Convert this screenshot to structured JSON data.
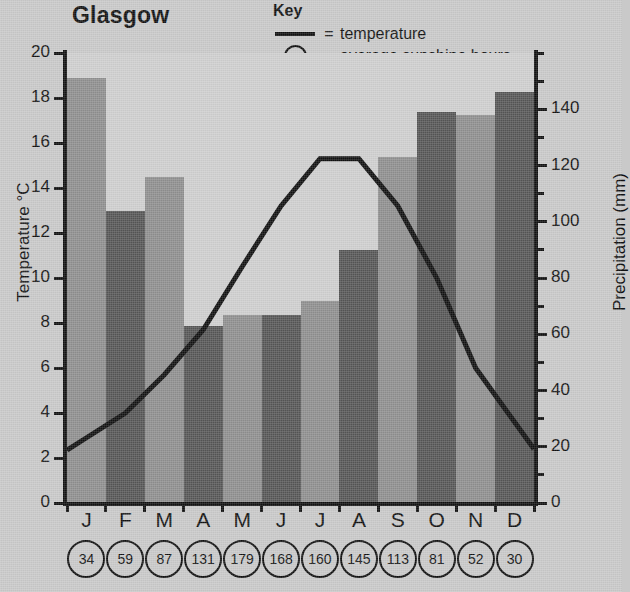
{
  "title": "Glasgow",
  "key": {
    "heading": "Key",
    "line_symbol": "line-swatch",
    "line_eq": "=",
    "line_label": "temperature",
    "circle_value": "34",
    "circle_eq": "=",
    "circle_label": "average sunshine hours"
  },
  "colors": {
    "background": "#c9c9c9",
    "plot_background": "#cfcfcf",
    "bar_light": "#8f8f8f",
    "bar_dark": "#565656",
    "line": "#111111",
    "axis": "#111111"
  },
  "chart_data": {
    "type": "bar",
    "title": "Glasgow",
    "categories": [
      "J",
      "F",
      "M",
      "A",
      "M",
      "J",
      "J",
      "A",
      "S",
      "O",
      "N",
      "D"
    ],
    "month_names": [
      "January",
      "February",
      "March",
      "April",
      "May",
      "June",
      "July",
      "August",
      "September",
      "October",
      "November",
      "December"
    ],
    "series": [
      {
        "name": "Precipitation (mm)",
        "type": "bar",
        "axis": "right",
        "values": [
          151,
          104,
          116,
          63,
          67,
          67,
          72,
          90,
          123,
          139,
          138,
          146
        ],
        "bar_shades": [
          "light",
          "dark",
          "light",
          "dark",
          "light",
          "dark",
          "light",
          "dark",
          "light",
          "dark",
          "light",
          "dark"
        ]
      },
      {
        "name": "temperature",
        "type": "line",
        "axis": "left",
        "values": [
          2.9,
          4.0,
          5.7,
          7.7,
          10.5,
          13.2,
          15.3,
          15.3,
          13.2,
          10.0,
          6.0,
          3.6
        ]
      },
      {
        "name": "average sunshine hours",
        "type": "annotation",
        "values": [
          34,
          59,
          87,
          131,
          179,
          168,
          160,
          145,
          113,
          81,
          52,
          30
        ]
      }
    ],
    "xlabel": "",
    "left_axis": {
      "label": "Temperature °C",
      "ticks": [
        0,
        2,
        4,
        6,
        8,
        10,
        12,
        14,
        16,
        18,
        20
      ],
      "lim": [
        0,
        20
      ]
    },
    "right_axis": {
      "label": "Precipitation (mm)",
      "ticks": [
        0,
        20,
        40,
        60,
        80,
        100,
        120,
        140
      ],
      "minor_step": 10,
      "lim": [
        0,
        160
      ]
    },
    "grid": false,
    "legend_position": "top-right"
  }
}
